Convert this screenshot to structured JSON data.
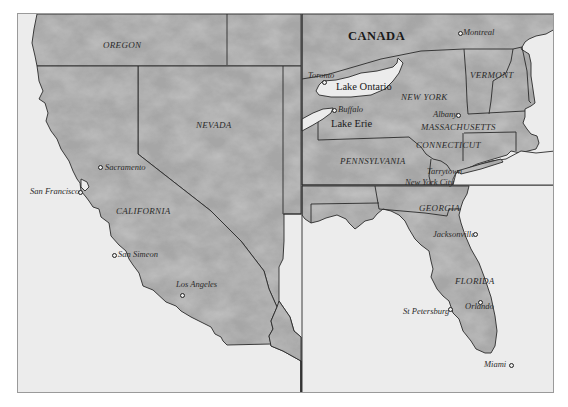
{
  "map": {
    "panels": [
      "west-coast",
      "northeast",
      "southeast"
    ],
    "colors": {
      "land": "#a9a9a9",
      "water": "#ececec",
      "border": "#2a2a2a",
      "frame": "#9a9a9a"
    },
    "country_labels": {
      "canada": "CANADA"
    },
    "state_labels": {
      "oregon": "OREGON",
      "nevada": "NEVADA",
      "california": "CALIFORNIA",
      "new_york": "NEW YORK",
      "vermont": "VERMONT",
      "massachusetts": "MASSACHUSETTS",
      "connecticut": "CONNECTICUT",
      "pennsylvania": "PENNSYLVANIA",
      "georgia": "GEORGIA",
      "florida": "FLORIDA"
    },
    "lake_labels": {
      "ontario": "Lake Ontario",
      "erie": "Lake Erie"
    },
    "city_labels": {
      "sacramento": "Sacramento",
      "san_francisco": "San Francisco",
      "san_simeon": "San Simeon",
      "los_angeles": "Los Angeles",
      "montreal": "Montreal",
      "toronto": "Toronto",
      "buffalo": "Buffalo",
      "albany": "Albany",
      "tarrytown": "Tarrytown",
      "new_york_city": "New York City",
      "jacksonville": "Jacksonville",
      "orlando": "Orlando",
      "st_petersburg": "St Petersburg",
      "miami": "Miami"
    }
  }
}
